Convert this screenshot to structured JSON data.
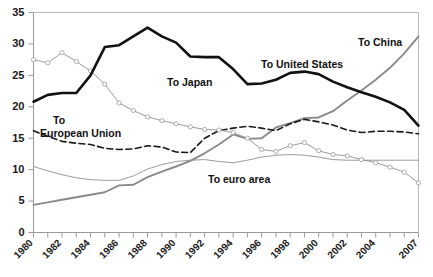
{
  "chart_data": {
    "type": "line",
    "title": "",
    "subtitle": "",
    "xlabel": "",
    "ylabel": "",
    "xlim": [
      1980,
      2007
    ],
    "ylim": [
      0,
      35
    ],
    "yticks": [
      0,
      5,
      10,
      15,
      20,
      25,
      30,
      35
    ],
    "xticks": [
      1980,
      1982,
      1984,
      1986,
      1988,
      1990,
      1992,
      1994,
      1996,
      1998,
      2000,
      2002,
      2004,
      2007
    ],
    "xtick_labels": [
      "1980",
      "1982",
      "1984",
      "1986",
      "1988",
      "1990",
      "1992",
      "1994",
      "1996",
      "1998",
      "2000",
      "2002",
      "2004",
      "2007"
    ],
    "grid": false,
    "legend": "inline-annotations",
    "x": [
      1980,
      1981,
      1982,
      1983,
      1984,
      1985,
      1986,
      1987,
      1988,
      1989,
      1990,
      1991,
      1992,
      1993,
      1994,
      1995,
      1996,
      1997,
      1998,
      1999,
      2000,
      2001,
      2002,
      2003,
      2004,
      2005,
      2006,
      2007
    ],
    "series": [
      {
        "name": "To United States",
        "label": "To United States",
        "style": "solid-thick-black",
        "color": "#111111",
        "markers": false,
        "values": [
          20.8,
          21.9,
          22.2,
          22.2,
          25.0,
          29.5,
          29.8,
          31.2,
          32.6,
          31.2,
          30.2,
          28.0,
          27.9,
          27.9,
          26.0,
          23.6,
          23.7,
          24.3,
          25.4,
          25.6,
          25.2,
          24.0,
          23.1,
          22.3,
          21.6,
          20.7,
          19.5,
          17.0
        ]
      },
      {
        "name": "To Japan",
        "label": "To Japan",
        "style": "solid-thin-gray-markers",
        "color": "#9b9b9b",
        "markers": true,
        "values": [
          27.5,
          27.0,
          28.6,
          27.2,
          25.7,
          23.6,
          20.6,
          19.4,
          18.4,
          17.8,
          17.3,
          16.8,
          16.4,
          16.3,
          15.9,
          15.0,
          13.2,
          12.9,
          13.8,
          14.3,
          13.0,
          12.4,
          12.2,
          11.6,
          11.1,
          10.4,
          9.6,
          7.9
        ]
      },
      {
        "name": "To European Union",
        "label": "To\nEuropean Union",
        "style": "dashed-black",
        "color": "#1a1a1a",
        "markers": false,
        "values": [
          16.2,
          15.3,
          14.5,
          14.2,
          14.0,
          13.4,
          13.2,
          13.3,
          13.8,
          13.6,
          12.8,
          12.7,
          15.0,
          16.2,
          16.6,
          16.9,
          16.6,
          16.2,
          17.3,
          18.0,
          17.6,
          17.1,
          16.3,
          15.9,
          16.1,
          16.1,
          16.0,
          15.7
        ]
      },
      {
        "name": "To China",
        "label": "To China",
        "style": "solid-gray-thick",
        "color": "#8a8a8a",
        "markers": false,
        "values": [
          4.4,
          4.8,
          5.2,
          5.6,
          6.0,
          6.4,
          7.5,
          7.6,
          8.8,
          9.7,
          10.5,
          11.4,
          12.6,
          14.0,
          15.6,
          14.9,
          15.0,
          16.7,
          17.4,
          18.2,
          18.3,
          19.3,
          21.0,
          22.6,
          24.3,
          26.2,
          28.5,
          31.2
        ]
      },
      {
        "name": "To euro area",
        "label": "To euro area",
        "style": "solid-thin-gray",
        "color": "#9b9b9b",
        "markers": false,
        "values": [
          10.5,
          9.8,
          9.2,
          8.7,
          8.4,
          8.3,
          8.3,
          9.0,
          10.1,
          10.8,
          11.3,
          11.5,
          11.6,
          11.3,
          11.1,
          11.5,
          12.0,
          12.3,
          12.4,
          12.3,
          12.0,
          11.6,
          11.5,
          11.5,
          11.5,
          11.5,
          11.5,
          11.5
        ]
      }
    ],
    "annotations": [
      {
        "name": "label-to-united-states",
        "text": "To United States",
        "x": 261,
        "y": 68
      },
      {
        "name": "label-to-japan",
        "text": "To Japan",
        "x": 167,
        "y": 86
      },
      {
        "name": "label-to-european-union-line1",
        "text": "To",
        "x": 53,
        "y": 124
      },
      {
        "name": "label-to-european-union-line2",
        "text": "European Union",
        "x": 40,
        "y": 137
      },
      {
        "name": "label-to-china",
        "text": "To China",
        "x": 358,
        "y": 46
      },
      {
        "name": "label-to-euro-area",
        "text": "To euro area",
        "x": 208,
        "y": 183
      }
    ]
  },
  "axis": {
    "y_labels": [
      "35",
      "30",
      "25",
      "20",
      "15",
      "10",
      "5",
      "0"
    ],
    "x_labels": [
      "1980",
      "1982",
      "1984",
      "1986",
      "1988",
      "1990",
      "1992",
      "1994",
      "1996",
      "1998",
      "2000",
      "2002",
      "2004",
      "2007"
    ]
  }
}
